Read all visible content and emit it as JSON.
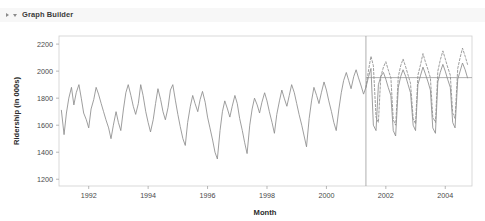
{
  "window": {
    "outline": {
      "title": "Graph Builder",
      "expand_icon": "triangle-right-icon",
      "collapse_icon": "triangle-down-icon"
    }
  },
  "chart_data": {
    "type": "line",
    "title": "",
    "xlabel": "Month",
    "ylabel": "Ridership (in 000s)",
    "xlim": [
      1991.0,
      2004.9
    ],
    "ylim": [
      1150,
      2260
    ],
    "grid": false,
    "legend": false,
    "x_ticks": [
      "1992",
      "1994",
      "1996",
      "1998",
      "2000",
      "2002",
      "2004"
    ],
    "x_tick_values": [
      1992,
      1994,
      1996,
      1998,
      2000,
      2002,
      2004
    ],
    "y_ticks": [
      "1200",
      "1400",
      "1600",
      "1800",
      "2000",
      "2200"
    ],
    "y_tick_values": [
      1200,
      1400,
      1600,
      1800,
      2000,
      2200
    ],
    "annotations": [
      {
        "name": "forecast-split-line",
        "type": "vline",
        "x": 2001.33,
        "style": "solid"
      },
      {
        "name": "forecast-mean-line",
        "type": "hline",
        "y": 1952,
        "x_start": 2001.33,
        "x_end": 2004.9,
        "style": "solid"
      }
    ],
    "series": [
      {
        "name": "Actual Ridership",
        "style": "solid",
        "color": "#8c8c8c",
        "x": [
          1991.08,
          1991.17,
          1991.25,
          1991.33,
          1991.42,
          1991.5,
          1991.58,
          1991.67,
          1991.75,
          1991.83,
          1991.92,
          1992.0,
          1992.08,
          1992.17,
          1992.25,
          1992.33,
          1992.42,
          1992.5,
          1992.58,
          1992.67,
          1992.75,
          1992.83,
          1992.92,
          1993.0,
          1993.08,
          1993.17,
          1993.25,
          1993.33,
          1993.42,
          1993.5,
          1993.58,
          1993.67,
          1993.75,
          1993.83,
          1993.92,
          1994.0,
          1994.08,
          1994.17,
          1994.25,
          1994.33,
          1994.42,
          1994.5,
          1994.58,
          1994.67,
          1994.75,
          1994.83,
          1994.92,
          1995.0,
          1995.08,
          1995.17,
          1995.25,
          1995.33,
          1995.42,
          1995.5,
          1995.58,
          1995.67,
          1995.75,
          1995.83,
          1995.92,
          1996.0,
          1996.08,
          1996.17,
          1996.25,
          1996.33,
          1996.42,
          1996.5,
          1996.58,
          1996.67,
          1996.75,
          1996.83,
          1996.92,
          1997.0,
          1997.08,
          1997.17,
          1997.25,
          1997.33,
          1997.42,
          1997.5,
          1997.58,
          1997.67,
          1997.75,
          1997.83,
          1997.92,
          1998.0,
          1998.08,
          1998.17,
          1998.25,
          1998.33,
          1998.42,
          1998.5,
          1998.58,
          1998.67,
          1998.75,
          1998.83,
          1998.92,
          1999.0,
          1999.08,
          1999.17,
          1999.25,
          1999.33,
          1999.42,
          1999.5,
          1999.58,
          1999.67,
          1999.75,
          1999.83,
          1999.92,
          2000.0,
          2000.08,
          2000.17,
          2000.25,
          2000.33,
          2000.42,
          2000.5,
          2000.58,
          2000.67,
          2000.75,
          2000.83,
          2000.92,
          2001.0,
          2001.08,
          2001.17,
          2001.25,
          2001.33,
          2001.42,
          2001.5,
          2001.58,
          2001.67,
          2001.75,
          2001.83,
          2001.92,
          2002.0,
          2002.08,
          2002.17,
          2002.25,
          2002.33,
          2002.42,
          2002.5,
          2002.58,
          2002.67,
          2002.75,
          2002.83,
          2002.92,
          2003.0,
          2003.08,
          2003.17,
          2003.25,
          2003.33,
          2003.42,
          2003.5,
          2003.58,
          2003.67,
          2003.75,
          2003.83,
          2003.92,
          2004.0,
          2004.08,
          2004.17,
          2004.25,
          2004.33,
          2004.42,
          2004.5,
          2004.58,
          2004.67,
          2004.75
        ],
        "y": [
          1710,
          1530,
          1690,
          1800,
          1880,
          1750,
          1840,
          1900,
          1800,
          1690,
          1640,
          1580,
          1720,
          1790,
          1880,
          1830,
          1760,
          1700,
          1640,
          1580,
          1500,
          1600,
          1700,
          1620,
          1560,
          1720,
          1840,
          1900,
          1820,
          1740,
          1680,
          1760,
          1900,
          1820,
          1700,
          1620,
          1550,
          1640,
          1760,
          1870,
          1790,
          1700,
          1640,
          1730,
          1860,
          1900,
          1780,
          1680,
          1590,
          1500,
          1450,
          1620,
          1740,
          1820,
          1760,
          1700,
          1790,
          1850,
          1770,
          1660,
          1580,
          1490,
          1400,
          1350,
          1560,
          1700,
          1780,
          1720,
          1660,
          1740,
          1820,
          1760,
          1650,
          1560,
          1470,
          1390,
          1600,
          1720,
          1800,
          1750,
          1690,
          1770,
          1840,
          1780,
          1700,
          1620,
          1540,
          1680,
          1780,
          1860,
          1800,
          1740,
          1820,
          1900,
          1840,
          1760,
          1680,
          1600,
          1520,
          1440,
          1650,
          1780,
          1880,
          1820,
          1760,
          1840,
          1920,
          1860,
          1780,
          1700,
          1620,
          1560,
          1720,
          1840,
          1930,
          1990,
          1930,
          1870,
          1960,
          2010,
          1950,
          1890,
          1830,
          1880,
          1960,
          2020,
          1600,
          1560,
          1900,
          1960,
          1990,
          1940,
          1880,
          1820,
          1560,
          1520,
          1880,
          1960,
          2010,
          1960,
          1900,
          1840,
          1600,
          1560,
          1900,
          1970,
          2030,
          1980,
          1920,
          1860,
          1580,
          1540,
          1920,
          1990,
          2050,
          2000,
          1940,
          1880,
          1620,
          1580,
          1940,
          2000,
          2060,
          2010,
          1950
        ]
      },
      {
        "name": "Forecast Ridership",
        "style": "dashed",
        "color": "#8c8c8c",
        "x": [
          2001.33,
          2001.42,
          2001.5,
          2001.58,
          2001.67,
          2001.75,
          2001.83,
          2001.92,
          2002.0,
          2002.08,
          2002.17,
          2002.25,
          2002.33,
          2002.42,
          2002.5,
          2002.58,
          2002.67,
          2002.75,
          2002.83,
          2002.92,
          2003.0,
          2003.08,
          2003.17,
          2003.25,
          2003.33,
          2003.42,
          2003.5,
          2003.58,
          2003.67,
          2003.75,
          2003.83,
          2003.92,
          2004.0,
          2004.08,
          2004.17,
          2004.25,
          2004.33,
          2004.42,
          2004.5,
          2004.58,
          2004.67,
          2004.75
        ],
        "y": [
          1880,
          2010,
          2110,
          2040,
          1660,
          1620,
          1960,
          2030,
          2070,
          2010,
          1950,
          1640,
          1600,
          1960,
          2040,
          2090,
          2030,
          1970,
          1910,
          1650,
          1610,
          1970,
          2050,
          2130,
          2070,
          2010,
          1950,
          1660,
          1620,
          2000,
          2080,
          2150,
          2090,
          2030,
          1970,
          1690,
          1650,
          2020,
          2100,
          2170,
          2110,
          2050
        ]
      }
    ]
  }
}
